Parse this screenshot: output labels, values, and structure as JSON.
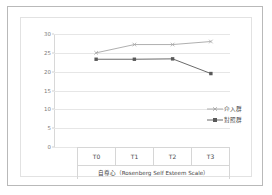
{
  "chart_data": {
    "type": "line",
    "title": "",
    "xlabel": "自尊心（Rosenberg Self Esteem Scale）",
    "ylabel": "",
    "categories": [
      "T0",
      "T1",
      "T2",
      "T3"
    ],
    "ylim": [
      0,
      30
    ],
    "yticks": [
      30,
      25,
      20,
      15,
      10,
      5,
      0
    ],
    "grid": true,
    "legend_position": "right",
    "series": [
      {
        "name": "介入群",
        "values": [
          25.0,
          27.2,
          27.2,
          28.0
        ],
        "color": "#a6a6a6",
        "marker": "cross"
      },
      {
        "name": "對照群",
        "values": [
          23.3,
          23.3,
          23.4,
          19.5
        ],
        "color": "#595959",
        "marker": "square"
      }
    ]
  },
  "axis": {
    "tick_30": "30",
    "tick_25": "25",
    "tick_20": "20",
    "tick_15": "15",
    "tick_10": "10",
    "tick_5": "5",
    "tick_0": "0",
    "cat_t0": "T0",
    "cat_t1": "T1",
    "cat_t2": "T2",
    "cat_t3": "T3"
  },
  "caption": {
    "text": "自尊心（Rosenberg Self Esteem Scale）"
  },
  "legend": {
    "entry_intervention": "介入群",
    "entry_control": "對照群"
  }
}
